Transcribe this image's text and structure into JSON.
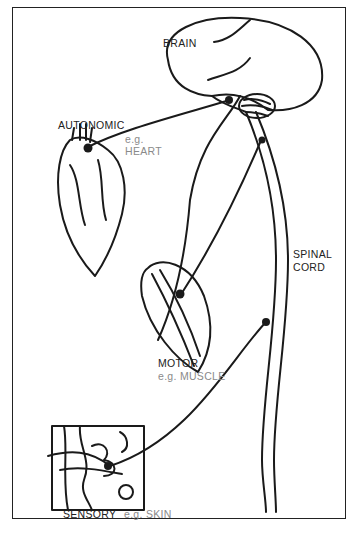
{
  "diagram": {
    "labels": {
      "brain": "BRAIN",
      "autonomic": "AUTONOMIC",
      "autonomic_example_prefix": "e.g.",
      "autonomic_example": "HEART",
      "spinal_cord_line1": "SPINAL",
      "spinal_cord_line2": "CORD",
      "motor": "MOTOR",
      "motor_example": "e.g. MUSCLE",
      "sensory": "SENSORY",
      "sensory_example": "e.g. SKIN"
    },
    "colors": {
      "line": "#1a1a1a",
      "example_text": "#8a8a8a",
      "frame": "#222222"
    }
  }
}
